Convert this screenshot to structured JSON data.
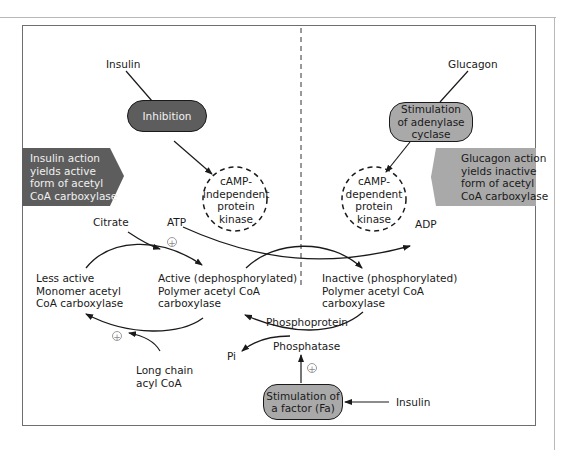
{
  "colors": {
    "dark_fill": "#5d5d5d",
    "light_fill": "#a9a9a9",
    "stroke": "#1a1a1a",
    "frame": "#6e6e6e"
  },
  "left": {
    "hormone": "Insulin",
    "effect_box": "Inhibition",
    "kinase": "cAMP-\nindependent\nprotein\nkinase",
    "banner": "Insulin action\nyields active\nform of acetyl\nCoA carboxylase"
  },
  "right": {
    "hormone": "Glucagon",
    "effect_box": "Stimulation\nof adenylase\ncyclase",
    "kinase": "cAMP-\ndependent\nprotein\nkinase",
    "banner": "Glucagon action\nyields inactive\nform of acetyl\nCoA carboxylase"
  },
  "metabolites": {
    "citrate": "Citrate",
    "atp": "ATP",
    "adp": "ADP",
    "pi": "Pi",
    "long_chain": "Long chain\nacyl CoA"
  },
  "enzyme_forms": {
    "monomer": "Less active\nMonomer acetyl\nCoA carboxylase",
    "active_polymer": "Active (dephosphorylated)\nPolymer acetyl CoA\ncarboxylase",
    "inactive_polymer": "Inactive (phosphorylated)\nPolymer acetyl CoA\ncarboxylase"
  },
  "phosphatase": {
    "line1": "Phosphoprotein",
    "line2": "Phosphatase",
    "activator_box": "Stimulation of\na factor (Fa)",
    "activator_hormone": "Insulin"
  },
  "plus_sign": "+"
}
